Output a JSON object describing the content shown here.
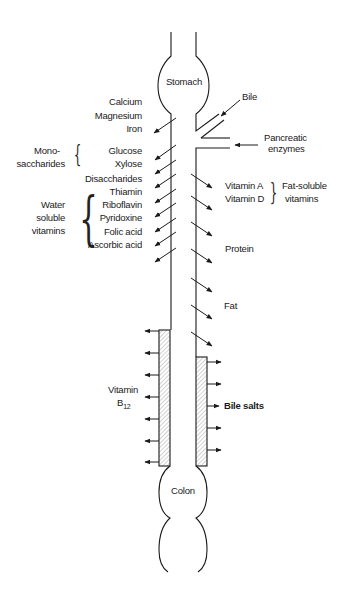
{
  "organs": {
    "stomach": "Stomach",
    "colon": "Colon"
  },
  "inputs": {
    "bile": "Bile",
    "pancreatic_enzymes_line1": "Pancreatic",
    "pancreatic_enzymes_line2": "enzymes"
  },
  "left_absorption": {
    "minerals": [
      "Calcium",
      "Magnesium",
      "Iron"
    ],
    "monosaccharides_group_line1": "Mono-",
    "monosaccharides_group_line2": "saccharides",
    "monosaccharides": [
      "Glucose",
      "Xylose"
    ],
    "disaccharides": "Disaccharides",
    "water_soluble_group": [
      "Water",
      "soluble",
      "vitamins"
    ],
    "water_soluble_vitamins": [
      "Thiamin",
      "Riboflavin",
      "Pyridoxine",
      "Folic acid",
      "Ascorbic acid"
    ]
  },
  "right_absorption": {
    "fat_soluble_vitamins": [
      "Vitamin A",
      "Vitamin D"
    ],
    "fat_soluble_group": [
      "Fat-soluble",
      "vitamins"
    ],
    "protein": "Protein",
    "fat": "Fat"
  },
  "ileum": {
    "vitamin_b12_line1": "Vitamin",
    "vitamin_b12_line2": "B",
    "vitamin_b12_sub": "12",
    "bile_salts": "Bile salts"
  },
  "colors": {
    "line": "#1a1a1a",
    "background": "#ffffff"
  }
}
